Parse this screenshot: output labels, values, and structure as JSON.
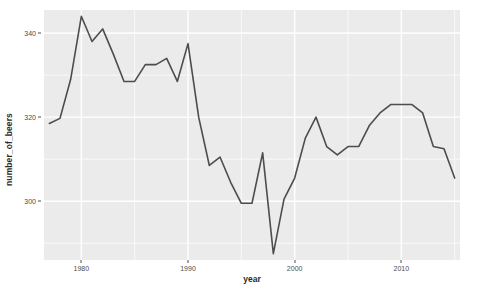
{
  "chart_data": {
    "type": "line",
    "title": "",
    "subtitle": "",
    "xlabel": "year",
    "ylabel": "number_of_beers",
    "xlim": [
      1976.5,
      2015.5
    ],
    "ylim": [
      286.0,
      345.5
    ],
    "xticks": [
      1980,
      1990,
      2000,
      2010
    ],
    "xtick_labels": [
      "1980",
      "1990",
      "2000",
      "2010"
    ],
    "yticks": [
      300,
      320,
      340
    ],
    "ytick_labels": [
      "300",
      "320",
      "340"
    ],
    "grid": true,
    "grid_color": "#ffffff",
    "panel_background": "#ebebeb",
    "legend": null,
    "legend_position": "none",
    "series": [
      {
        "name": "number_of_beers",
        "color": "#4d4d4d",
        "line_width": 1.6,
        "x": [
          1977,
          1978,
          1979,
          1980,
          1981,
          1982,
          1983,
          1984,
          1985,
          1986,
          1987,
          1988,
          1989,
          1990,
          1991,
          1992,
          1993,
          1994,
          1995,
          1996,
          1997,
          1998,
          1999,
          2000,
          2001,
          2002,
          2003,
          2004,
          2005,
          2006,
          2007,
          2008,
          2009,
          2010,
          2011,
          2012,
          2013,
          2014,
          2015
        ],
        "y": [
          318.5,
          319.7,
          329.0,
          344.0,
          338.0,
          341.0,
          335.0,
          328.5,
          328.5,
          332.5,
          332.5,
          334.0,
          328.5,
          337.5,
          320.0,
          308.5,
          310.5,
          304.5,
          299.5,
          299.5,
          311.5,
          287.5,
          300.5,
          305.5,
          315.0,
          320.0,
          313.0,
          311.0,
          313.0,
          313.0,
          318.0,
          321.0,
          323.0,
          323.0,
          323.0,
          321.0,
          313.0,
          312.5,
          305.5
        ]
      }
    ]
  }
}
